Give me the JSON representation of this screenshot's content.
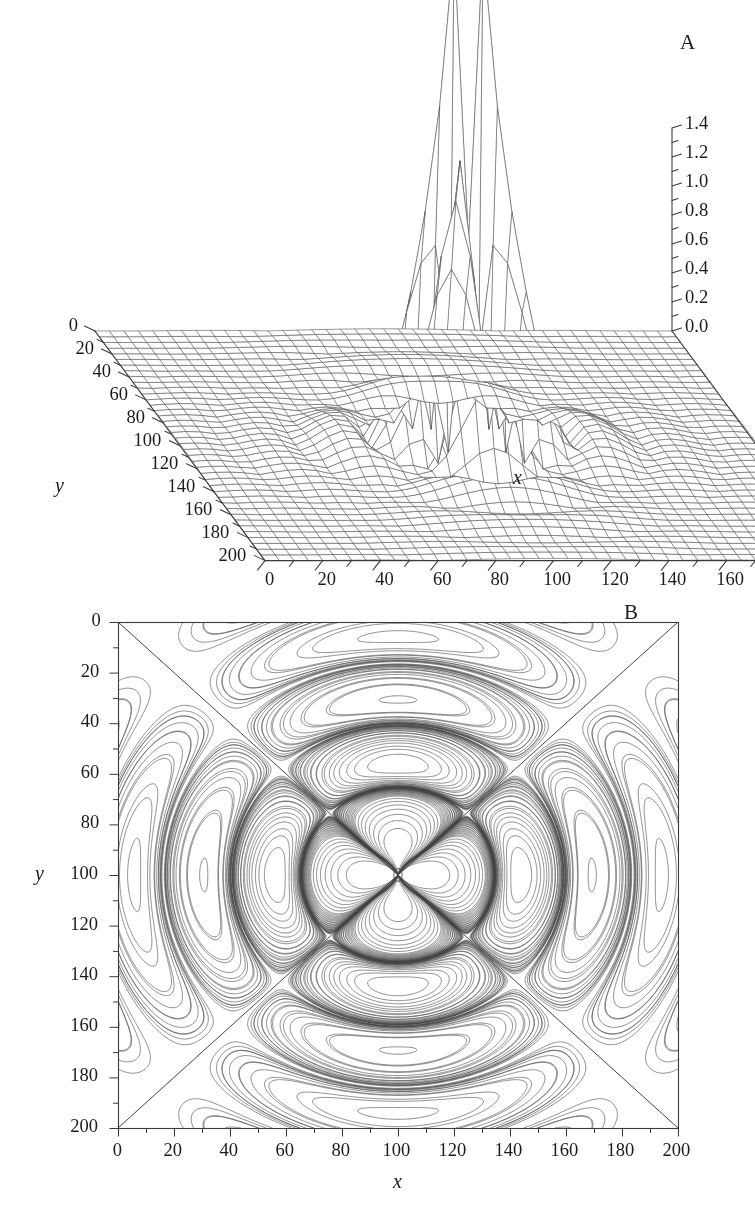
{
  "figure": {
    "background": "#ffffff",
    "ink": "#2b2b2b",
    "width": 755,
    "height": 1212
  },
  "panels": [
    {
      "id": "A",
      "label": "A",
      "type": "surface3d"
    },
    {
      "id": "B",
      "label": "B",
      "type": "contour"
    }
  ],
  "panelA": {
    "label": "A",
    "axes": {
      "x": {
        "title": "x",
        "ticks": [
          0,
          20,
          40,
          60,
          80,
          100,
          120,
          140,
          160,
          180,
          200
        ],
        "tick_labels": [
          "0",
          "20",
          "40",
          "60",
          "80",
          "100",
          "120",
          "140",
          "160",
          "180",
          "200"
        ],
        "min": 0,
        "max": 200,
        "minor_step": 10
      },
      "y": {
        "title": "y",
        "ticks": [
          0,
          20,
          40,
          60,
          80,
          100,
          120,
          140,
          160,
          180,
          200
        ],
        "tick_labels": [
          "0",
          "20",
          "40",
          "60",
          "80",
          "100",
          "120",
          "140",
          "160",
          "180",
          "200"
        ],
        "min": 0,
        "max": 200,
        "minor_step": 10
      },
      "z": {
        "title": "",
        "ticks": [
          0.0,
          0.2,
          0.4,
          0.6,
          0.8,
          1.0,
          1.2,
          1.4
        ],
        "tick_labels": [
          "0.0",
          "0.2",
          "0.4",
          "0.6",
          "0.8",
          "1.0",
          "1.2",
          "1.4"
        ],
        "min": 0.0,
        "max": 1.4,
        "minor_step": 0.1
      }
    },
    "mesh": {
      "style": "wireframe",
      "line_color": "#555555",
      "nx": 41,
      "ny": 41,
      "peak_value": 1.4,
      "peak_x": 100,
      "peak_y": 100
    }
  },
  "panelB": {
    "label": "B",
    "axes": {
      "x": {
        "title": "x",
        "ticks": [
          0,
          20,
          40,
          60,
          80,
          100,
          120,
          140,
          160,
          180,
          200
        ],
        "tick_labels": [
          "0",
          "20",
          "40",
          "60",
          "80",
          "100",
          "120",
          "140",
          "160",
          "180",
          "200"
        ],
        "min": 0,
        "max": 200,
        "minor_step": 10
      },
      "y": {
        "title": "y",
        "ticks": [
          0,
          20,
          40,
          60,
          80,
          100,
          120,
          140,
          160,
          180,
          200
        ],
        "tick_labels": [
          "0",
          "20",
          "40",
          "60",
          "80",
          "100",
          "120",
          "140",
          "160",
          "180",
          "200"
        ],
        "min": 0,
        "max": 200,
        "inverted": true,
        "minor_step": 10
      }
    },
    "contours": {
      "line_color": "#444444",
      "levels_hint": "dense near centre, ~40 levels, log-like spacing",
      "features": [
        "four-lobed quadrupole pattern",
        "two diagonal zero-lines corner to corner",
        "secondary maxima near (68,100) and (132,100)",
        "sharp central maximum at (100,100)"
      ]
    }
  },
  "chart_data": {
    "type": "contour",
    "title": "",
    "subtitle": "",
    "xlabel": "x",
    "ylabel": "y",
    "xlim": [
      0,
      200
    ],
    "ylim": [
      0,
      200
    ],
    "zlim": [
      0.0,
      1.4
    ],
    "grid": false,
    "legend": null,
    "function": "quadrupole point-spread amplitude with sharp central peak",
    "peak": {
      "x": 100,
      "y": 100,
      "z": 1.4
    },
    "secondary_maxima": [
      {
        "x": 68,
        "y": 100,
        "z": 0.18
      },
      {
        "x": 132,
        "y": 100,
        "z": 0.18
      },
      {
        "x": 100,
        "y": 68,
        "z": 0.18
      },
      {
        "x": 100,
        "y": 132,
        "z": 0.18
      }
    ],
    "zero_lines": [
      {
        "from": [
          0,
          0
        ],
        "to": [
          200,
          200
        ]
      },
      {
        "from": [
          0,
          200
        ],
        "to": [
          200,
          0
        ]
      }
    ],
    "panelA_axis_ticks": {
      "x": [
        0,
        20,
        40,
        60,
        80,
        100,
        120,
        140,
        160,
        180,
        200
      ],
      "y": [
        0,
        20,
        40,
        60,
        80,
        100,
        120,
        140,
        160,
        180,
        200
      ],
      "z": [
        0.0,
        0.2,
        0.4,
        0.6,
        0.8,
        1.0,
        1.2,
        1.4
      ]
    },
    "panelB_axis_ticks": {
      "x": [
        0,
        20,
        40,
        60,
        80,
        100,
        120,
        140,
        160,
        180,
        200
      ],
      "y": [
        0,
        20,
        40,
        60,
        80,
        100,
        120,
        140,
        160,
        180,
        200
      ]
    }
  }
}
